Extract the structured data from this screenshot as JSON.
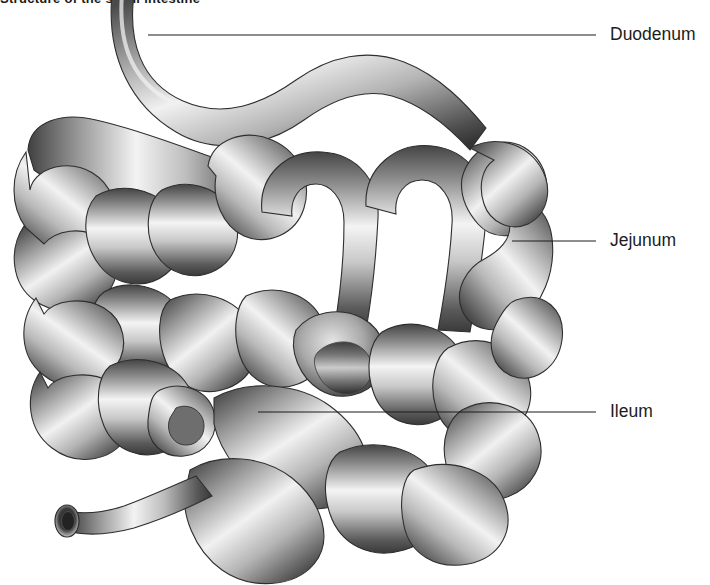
{
  "figure": {
    "title": "Structure of the small intestine",
    "style": "grayscale-medical-illustration",
    "background_color": "#ffffff",
    "ink_color": "#1c1c1c",
    "tube_highlight_color": "#f2f2f2",
    "tube_midtone_color": "#9a9a9a",
    "tube_shadow_color": "#3c3c3c",
    "outline_color": "#2e2e2e"
  },
  "labels": [
    {
      "id": "duodenum",
      "text": "Duodenum",
      "text_x": 610,
      "text_y": 26,
      "leader_x1": 148,
      "leader_y1": 35,
      "leader_x2": 596,
      "leader_y2": 35
    },
    {
      "id": "jejunum",
      "text": "Jejunum",
      "text_x": 610,
      "text_y": 232,
      "leader_x1": 512,
      "leader_y1": 241,
      "leader_x2": 596,
      "leader_y2": 241
    },
    {
      "id": "ileum",
      "text": "Ileum",
      "text_x": 610,
      "text_y": 403,
      "leader_x1": 258,
      "leader_y1": 412,
      "leader_x2": 596,
      "leader_y2": 412
    }
  ],
  "anatomy_parts": [
    {
      "name": "Duodenum",
      "description": "smooth C-shaped tube entering from top of figure"
    },
    {
      "name": "Jejunum",
      "description": "upper coiled loops of small intestine"
    },
    {
      "name": "Ileum",
      "description": "lower coiled loops of small intestine, cut end at lower left"
    }
  ],
  "cut_end": {
    "name": "cut-lumen",
    "center_x": 66,
    "center_y": 512,
    "description": "open cut end of intestine showing lumen"
  }
}
